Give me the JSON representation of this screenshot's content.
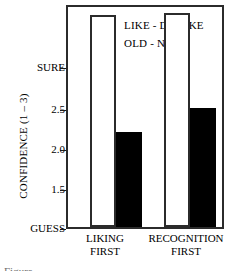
{
  "chart_data": {
    "type": "bar",
    "title": "",
    "subtitle": "",
    "xlabel": "",
    "ylabel": "CONFIDENCE (1 – 3)",
    "categories": [
      "LIKING FIRST",
      "RECOGNITION FIRST"
    ],
    "category_lines": [
      [
        "LIKING",
        "FIRST"
      ],
      [
        "RECOGNITION",
        "FIRST"
      ]
    ],
    "series": [
      {
        "name": "LIKE - DISLIKE",
        "style": "open",
        "color": "#ffffff",
        "edge_color": "#2b2b2b",
        "values": [
          2.98,
          2.99
        ]
      },
      {
        "name": "OLD - NEW",
        "style": "filled",
        "color": "#000000",
        "edge_color": "#000000",
        "values": [
          1.89,
          2.11
        ]
      }
    ],
    "ylim": [
      1.0,
      3.05
    ],
    "yticks": [
      1.0,
      1.5,
      2.0,
      2.5,
      3.0
    ],
    "ytick_labels": [
      "GUESS",
      "1.5",
      "2.0",
      "2.5",
      "SURE"
    ],
    "grid": false,
    "legend_position": "top-left-inside",
    "frame": true
  },
  "legend": {
    "entries": [
      {
        "label": "LIKE - DISLIKE",
        "swatch": "open-square-swatch"
      },
      {
        "label": "OLD - NEW",
        "swatch": "filled-square-swatch"
      }
    ]
  },
  "axes": {
    "y_title": "CONFIDENCE (1 – 3)",
    "y_tick_labels": {
      "t3": "SURE",
      "t25": "2.5",
      "t20": "2.0",
      "t15": "1.5",
      "t1": "GUESS"
    },
    "x_group_1_line1": "LIKING",
    "x_group_1_line2": "FIRST",
    "x_group_2_line1": "RECOGNITION",
    "x_group_2_line2": "FIRST"
  },
  "caption": {
    "text": "Figure"
  },
  "colors": {
    "axis": "#2b2b2b",
    "bar_filled": "#000000",
    "bar_open": "#ffffff",
    "background": "#ffffff",
    "text": "#000000"
  }
}
